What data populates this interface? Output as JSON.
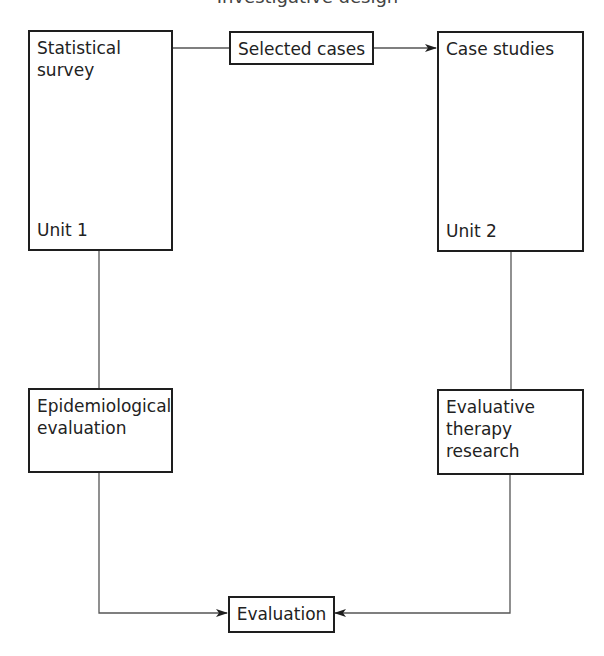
{
  "title": {
    "text": "Investigative design",
    "clipped": true
  },
  "nodes": {
    "statistical_survey": {
      "label": "Statistical\nsurvey",
      "unit": "Unit 1"
    },
    "selected_cases": {
      "label": "Selected cases"
    },
    "case_studies": {
      "label": "Case studies",
      "unit": "Unit 2"
    },
    "epidemiological_evaluation": {
      "label": "Epidemiological\nevaluation"
    },
    "evaluative_therapy_research": {
      "label": "Evaluative\ntherapy\nresearch"
    },
    "evaluation": {
      "label": "Evaluation"
    }
  },
  "edges": [
    {
      "from": "statistical_survey",
      "to": "selected_cases",
      "arrow": false
    },
    {
      "from": "selected_cases",
      "to": "case_studies",
      "arrow": true
    },
    {
      "from": "statistical_survey",
      "to": "epidemiological_evaluation",
      "arrow": false
    },
    {
      "from": "case_studies",
      "to": "evaluative_therapy_research",
      "arrow": false
    },
    {
      "from": "epidemiological_evaluation",
      "to": "evaluation",
      "arrow": true
    },
    {
      "from": "evaluative_therapy_research",
      "to": "evaluation",
      "arrow": true
    }
  ],
  "colors": {
    "stroke": "#1e1e1e",
    "line": "#555555",
    "background": "#ffffff"
  }
}
